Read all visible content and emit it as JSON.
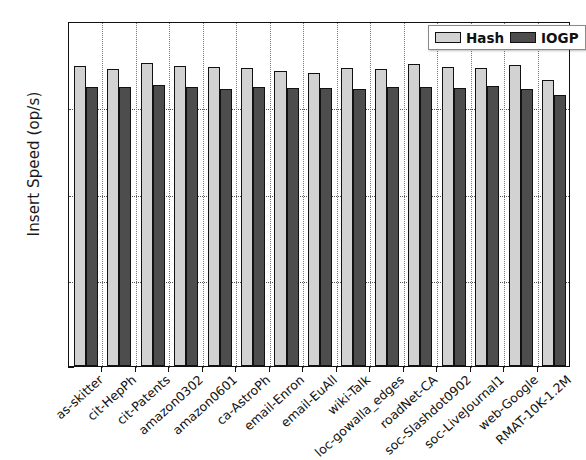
{
  "chart_data": {
    "type": "bar",
    "title": "",
    "xlabel": "",
    "ylabel": "Insert Speed (op/s)",
    "ylim": [
      0,
      2000
    ],
    "yticks": [
      0,
      500,
      1000,
      1500,
      2000
    ],
    "ytick_labels": [
      "0",
      "500",
      "1000",
      "1500",
      "2000"
    ],
    "grid": true,
    "legend_position": "upper right",
    "categories": [
      "as-skitter",
      "cit-HepPh",
      "cit-Patents",
      "amazon0302",
      "amazon0601",
      "ca-AstroPh",
      "email-Enron",
      "email-EuAll",
      "wiki-Talk",
      "loc-gowalla_edges",
      "roadNet-CA",
      "soc-Slashdot0902",
      "soc-LiveJournal1",
      "web-Google",
      "RMAT-10K-1.2M"
    ],
    "series": [
      {
        "name": "Hash",
        "color": "#d2d2d2",
        "values": [
          1740,
          1720,
          1755,
          1740,
          1735,
          1730,
          1710,
          1700,
          1730,
          1720,
          1750,
          1735,
          1730,
          1745,
          1660
        ]
      },
      {
        "name": "IOGP",
        "color": "#4d4d4d",
        "values": [
          1620,
          1615,
          1630,
          1615,
          1605,
          1620,
          1610,
          1610,
          1605,
          1615,
          1620,
          1610,
          1625,
          1605,
          1570
        ]
      }
    ]
  },
  "legend": {
    "items": [
      {
        "label": "Hash",
        "color": "#d2d2d2"
      },
      {
        "label": "IOGP",
        "color": "#4d4d4d"
      }
    ]
  }
}
